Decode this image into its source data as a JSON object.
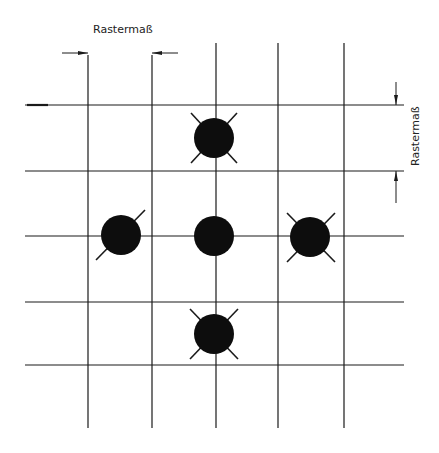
{
  "diagram": {
    "labels": {
      "top_dimension": "Rastermaß",
      "right_dimension": "Rastermaß"
    },
    "grid": {
      "vertical_lines_x": [
        88,
        152,
        216,
        278,
        344
      ],
      "horizontal_lines_y": [
        105,
        171,
        236,
        302,
        365
      ],
      "line_color": "#1a1a1a"
    },
    "holes": [
      {
        "name": "top",
        "cx": 214,
        "cy": 138,
        "r": 20,
        "diagonals": "x"
      },
      {
        "name": "left",
        "cx": 121,
        "cy": 235,
        "r": 20,
        "diagonals": "ne-sw"
      },
      {
        "name": "center",
        "cx": 214,
        "cy": 236,
        "r": 20,
        "diagonals": "none"
      },
      {
        "name": "right",
        "cx": 310,
        "cy": 237,
        "r": 20,
        "diagonals": "x"
      },
      {
        "name": "bottom",
        "cx": 214,
        "cy": 334,
        "r": 20,
        "diagonals": "x"
      }
    ],
    "fill_color": "#0d0d0d"
  }
}
